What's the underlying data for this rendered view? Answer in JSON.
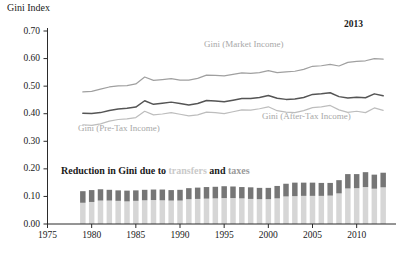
{
  "chart_data": {
    "type": "line",
    "title": "",
    "ylabel": "Gini Index",
    "xlabel": "",
    "ylim": [
      0.0,
      0.7
    ],
    "xlim": [
      1975,
      2014
    ],
    "ytick_labels": [
      "0.00",
      "0.10",
      "0.20",
      "0.30",
      "0.40",
      "0.50",
      "0.60",
      "0.70"
    ],
    "ytick_values": [
      0.0,
      0.1,
      0.2,
      0.3,
      0.4,
      0.5,
      0.6,
      0.7
    ],
    "xtick_labels": [
      "1975",
      "1980",
      "1985",
      "1990",
      "1995",
      "2000",
      "2005",
      "2010"
    ],
    "xtick_values": [
      1975,
      1980,
      1985,
      1990,
      1995,
      2000,
      2005,
      2010
    ],
    "grid": false,
    "legend_position": "in-plot-labels",
    "annotations": [
      {
        "text": "2013",
        "x": 2012,
        "y": 0.66,
        "bold": true
      }
    ],
    "x": [
      1979,
      1980,
      1981,
      1982,
      1983,
      1984,
      1985,
      1986,
      1987,
      1988,
      1989,
      1990,
      1991,
      1992,
      1993,
      1994,
      1995,
      1996,
      1997,
      1998,
      1999,
      2000,
      2001,
      2002,
      2003,
      2004,
      2005,
      2006,
      2007,
      2008,
      2009,
      2010,
      2011,
      2012,
      2013
    ],
    "series": [
      {
        "name": "Gini (Market Income)",
        "color": "#a0a0a0",
        "label_text": "Gini (Market Income)",
        "values": [
          0.479,
          0.481,
          0.489,
          0.497,
          0.501,
          0.502,
          0.508,
          0.533,
          0.521,
          0.524,
          0.527,
          0.522,
          0.522,
          0.528,
          0.54,
          0.539,
          0.537,
          0.543,
          0.548,
          0.546,
          0.549,
          0.556,
          0.549,
          0.552,
          0.554,
          0.561,
          0.572,
          0.574,
          0.579,
          0.573,
          0.586,
          0.59,
          0.592,
          0.6,
          0.598
        ]
      },
      {
        "name": "Gini (Pre-Tax Income)",
        "color": "#555555",
        "label_text": "Gini (Pre-Tax Income)",
        "values": [
          0.402,
          0.401,
          0.404,
          0.412,
          0.417,
          0.42,
          0.424,
          0.447,
          0.434,
          0.438,
          0.442,
          0.437,
          0.432,
          0.437,
          0.448,
          0.446,
          0.443,
          0.449,
          0.455,
          0.455,
          0.459,
          0.466,
          0.456,
          0.452,
          0.453,
          0.459,
          0.47,
          0.472,
          0.476,
          0.462,
          0.457,
          0.46,
          0.458,
          0.472,
          0.465
        ]
      },
      {
        "name": "Gini (After-Tax Income)",
        "color": "#bdbdbd",
        "label_text": "Gini (After-Tax Income)",
        "values": [
          0.36,
          0.358,
          0.363,
          0.373,
          0.379,
          0.381,
          0.386,
          0.409,
          0.396,
          0.399,
          0.404,
          0.398,
          0.392,
          0.396,
          0.406,
          0.404,
          0.4,
          0.407,
          0.414,
          0.413,
          0.418,
          0.425,
          0.411,
          0.406,
          0.404,
          0.411,
          0.422,
          0.425,
          0.43,
          0.414,
          0.405,
          0.409,
          0.404,
          0.421,
          0.412
        ]
      }
    ],
    "bars": {
      "caption_segments": [
        {
          "text": "Reduction in Gini due to ",
          "color": "#1a1a1a"
        },
        {
          "text": "transfers",
          "color": "#c9c9c9"
        },
        {
          "text": " and ",
          "color": "#1a1a1a"
        },
        {
          "text": "taxes",
          "color": "#9a9a9a"
        }
      ],
      "stacked": true,
      "categories": [
        1979,
        1980,
        1981,
        1982,
        1983,
        1984,
        1985,
        1986,
        1987,
        1988,
        1989,
        1990,
        1991,
        1992,
        1993,
        1994,
        1995,
        1996,
        1997,
        1998,
        1999,
        2000,
        2001,
        2002,
        2003,
        2004,
        2005,
        2006,
        2007,
        2008,
        2009,
        2010,
        2011,
        2012,
        2013
      ],
      "segments": [
        {
          "name": "transfers",
          "color": "#d6d6d6",
          "values": [
            0.077,
            0.08,
            0.085,
            0.085,
            0.084,
            0.082,
            0.084,
            0.086,
            0.087,
            0.086,
            0.085,
            0.085,
            0.09,
            0.091,
            0.092,
            0.093,
            0.094,
            0.094,
            0.093,
            0.091,
            0.09,
            0.09,
            0.093,
            0.1,
            0.101,
            0.102,
            0.102,
            0.102,
            0.103,
            0.111,
            0.129,
            0.13,
            0.134,
            0.128,
            0.133
          ]
        },
        {
          "name": "taxes",
          "color": "#767676",
          "values": [
            0.042,
            0.043,
            0.041,
            0.039,
            0.038,
            0.039,
            0.038,
            0.038,
            0.038,
            0.039,
            0.038,
            0.039,
            0.04,
            0.041,
            0.042,
            0.042,
            0.043,
            0.042,
            0.041,
            0.042,
            0.041,
            0.041,
            0.045,
            0.046,
            0.049,
            0.048,
            0.048,
            0.047,
            0.046,
            0.048,
            0.052,
            0.051,
            0.054,
            0.051,
            0.053
          ]
        }
      ]
    }
  }
}
